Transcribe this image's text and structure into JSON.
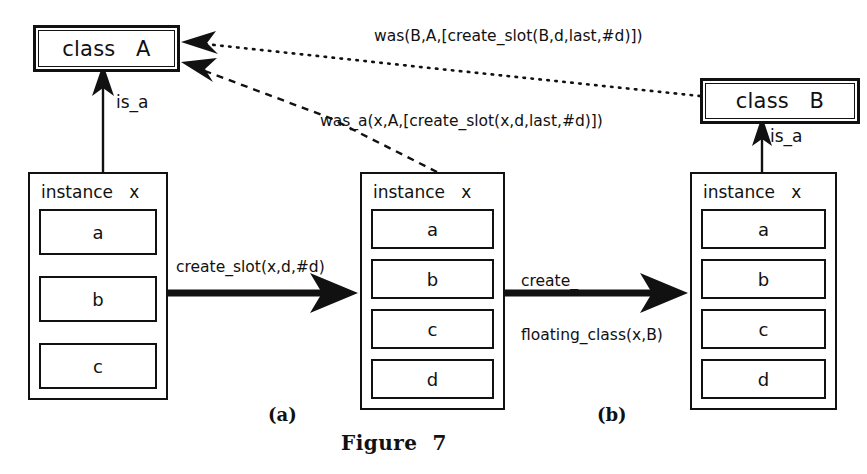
{
  "figure": {
    "caption": "Figure  7",
    "panels": [
      {
        "id": "a",
        "label": "(a)"
      },
      {
        "id": "b",
        "label": "(b)"
      }
    ]
  },
  "classes": {
    "a": {
      "keyword": "class",
      "name": "A",
      "label": "class   A"
    },
    "b": {
      "keyword": "class",
      "name": "B",
      "label": "class   B"
    }
  },
  "instances": {
    "left": {
      "title": "instance   x",
      "slots": [
        "a",
        "b",
        "c"
      ]
    },
    "middle": {
      "title": "instance   x",
      "slots": [
        "a",
        "b",
        "c",
        "d"
      ]
    },
    "right": {
      "title": "instance   x",
      "slots": [
        "a",
        "b",
        "c",
        "d"
      ]
    }
  },
  "edges": {
    "isa_left": "is_a",
    "isa_right": "is_a",
    "transition_1": "create_slot(x,d,#d)",
    "transition_2_line1": "create_",
    "transition_2_line2": "floating_class(x,B)",
    "was_b_a": "was(B,A,[create_slot(B,d,last,#d)])",
    "was_a_x_a": "was_a(x,A,[create_slot(x,d,last,#d)])"
  },
  "colors": {
    "ink": "#111111",
    "paper": "#ffffff"
  }
}
